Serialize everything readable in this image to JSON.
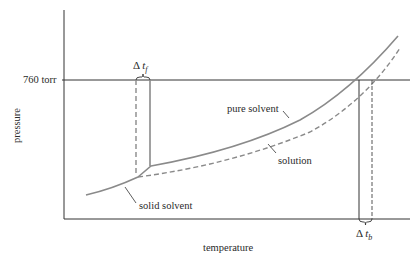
{
  "diagram": {
    "type": "phase-diagram",
    "axes": {
      "x_label": "temperature",
      "y_label": "pressure",
      "y_tick_label": "760 torr"
    },
    "curves": [
      {
        "name": "pure-solvent",
        "label": "pure solvent",
        "style": "solid"
      },
      {
        "name": "solution",
        "label": "solution",
        "style": "dashed"
      },
      {
        "name": "solid-solvent",
        "label": "solid solvent",
        "style": "solid"
      }
    ],
    "annotations": {
      "delta_tf": {
        "symbol": "Δ",
        "var": "t",
        "sub": "f"
      },
      "delta_tb": {
        "symbol": "Δ",
        "var": "t",
        "sub": "b"
      }
    },
    "colors": {
      "axis": "#333333",
      "curve": "#8a8a8a",
      "text": "#2a2a2a"
    }
  }
}
